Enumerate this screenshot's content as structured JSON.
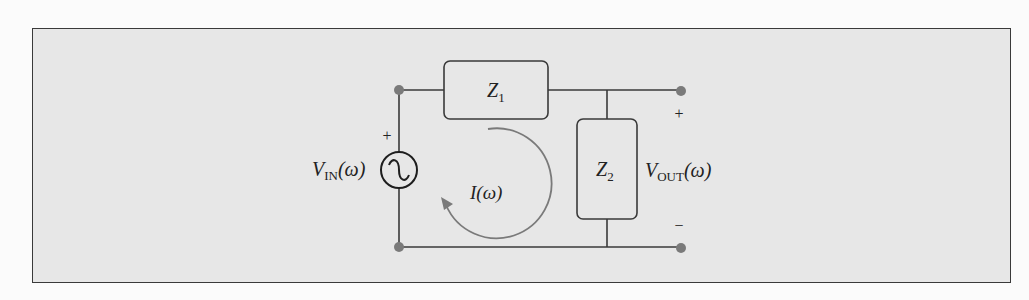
{
  "figure": {
    "type": "circuit-schematic",
    "background_color": "#e7e7e7",
    "wire_color": "#3a3a3a",
    "node_color": "#7a7a7a",
    "current_arrow_color": "#7a7a7a"
  },
  "components": {
    "source": {
      "symbol": "ac-voltage-source",
      "label_main": "V",
      "label_sub": "IN",
      "label_arg": "(ω)",
      "polarity_plus": "+"
    },
    "z1": {
      "label_main": "Z",
      "label_sub": "1"
    },
    "z2": {
      "label_main": "Z",
      "label_sub": "2"
    },
    "current": {
      "label": "I(ω)",
      "direction": "clockwise"
    },
    "output": {
      "label_main": "V",
      "label_sub": "OUT",
      "label_arg": "(ω)",
      "polarity_plus": "+",
      "polarity_minus": "−"
    }
  },
  "nodes": [
    {
      "id": "in-top",
      "x": 399,
      "y": 90
    },
    {
      "id": "in-bottom",
      "x": 399,
      "y": 247
    },
    {
      "id": "out-top",
      "x": 681,
      "y": 91
    },
    {
      "id": "out-bottom",
      "x": 681,
      "y": 248
    }
  ]
}
